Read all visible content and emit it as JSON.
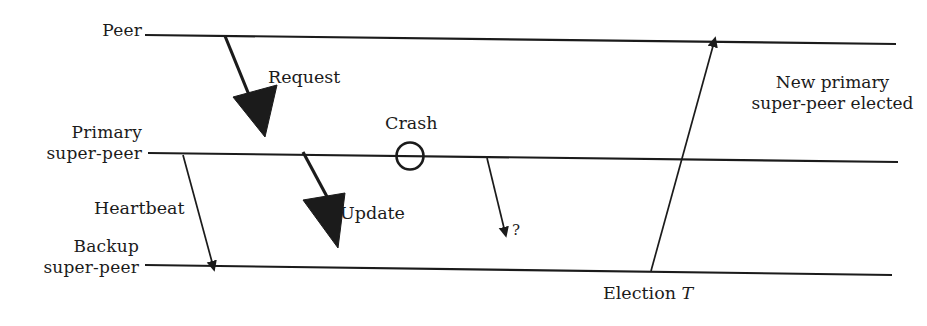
{
  "diagram": {
    "type": "sequence-timeline",
    "background_color": "#ffffff",
    "line_color": "#1b1b1b",
    "text_color": "#1b1b1b",
    "actors": [
      {
        "id": "peer",
        "label_line1": "Peer",
        "label_line2": "",
        "timeline_y_left": 35,
        "timeline_y_right": 44
      },
      {
        "id": "primary-super-peer",
        "label_line1": "Primary",
        "label_line2": "super-peer",
        "timeline_y_left": 153,
        "timeline_y_right": 161
      },
      {
        "id": "backup-super-peer",
        "label_line1": "Backup",
        "label_line2": "super-peer",
        "timeline_y_left": 265,
        "timeline_y_right": 274
      }
    ],
    "messages": [
      {
        "id": "request",
        "label": "Request",
        "from": "peer",
        "to": "primary-super-peer",
        "style": "thick-solid-arrow"
      },
      {
        "id": "heartbeat",
        "label": "Heartbeat",
        "from": "primary-super-peer",
        "to": "backup-super-peer",
        "style": "thin-solid-arrow"
      },
      {
        "id": "update",
        "label": "Update",
        "from": "primary-super-peer",
        "to": "backup-super-peer",
        "style": "thick-solid-arrow"
      },
      {
        "id": "unknown",
        "label": "?",
        "from": "primary-super-peer",
        "to": "backup-super-peer",
        "style": "thin-solid-arrow"
      },
      {
        "id": "election",
        "label": "Election",
        "label_suffix_italic": "T",
        "from": "backup-super-peer",
        "to": "peer",
        "style": "thin-solid-arrow-up"
      }
    ],
    "events": [
      {
        "id": "crash",
        "label": "Crash",
        "marker": "circle-outline",
        "on": "primary-super-peer",
        "cx": 410,
        "cy": 156,
        "r": 13
      }
    ],
    "notes": [
      {
        "id": "new-primary-elected",
        "line1": "New primary",
        "line2": "super-peer elected"
      },
      {
        "id": "election-time",
        "text": "Election",
        "italic_symbol": "T"
      }
    ]
  }
}
